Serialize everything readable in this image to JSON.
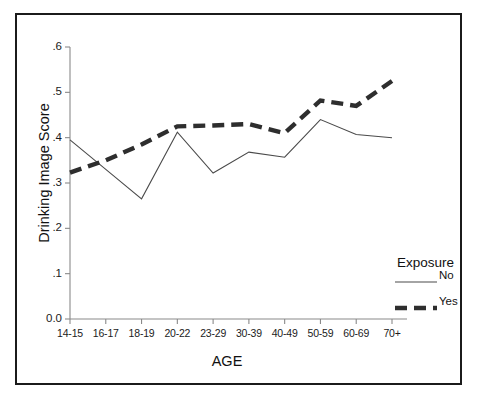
{
  "chart_data": {
    "type": "line",
    "title": "",
    "xlabel": "AGE",
    "ylabel": "Drinking Image Score",
    "categories": [
      "14-15",
      "16-17",
      "18-19",
      "20-22",
      "23-29",
      "30-39",
      "40-49",
      "50-59",
      "60-69",
      "70+"
    ],
    "ylim": [
      0.0,
      0.6
    ],
    "ytick_labels": [
      "0.0",
      ".1",
      ".2",
      ".3",
      ".4",
      ".5",
      ".6"
    ],
    "ytick_values": [
      0.0,
      0.1,
      0.2,
      0.3,
      0.4,
      0.5,
      0.6
    ],
    "grid": false,
    "legend_position": "right",
    "legend_title": "Exposure",
    "series": [
      {
        "name": "No",
        "style": "solid",
        "color": "#4a4a4a",
        "values": [
          0.395,
          0.33,
          0.265,
          0.412,
          0.322,
          0.368,
          0.357,
          0.44,
          0.407,
          0.4
        ]
      },
      {
        "name": "Yes",
        "style": "dashed",
        "color": "#2e2e2e",
        "values": [
          0.323,
          0.35,
          0.385,
          0.425,
          0.427,
          0.43,
          0.41,
          0.482,
          0.47,
          0.525
        ]
      }
    ]
  },
  "legend": {
    "title": "Exposure",
    "entries": [
      {
        "label": "No",
        "style": "solid"
      },
      {
        "label": "Yes",
        "style": "dashed"
      }
    ]
  },
  "axes": {
    "x_title": "AGE",
    "y_title": "Drinking Image Score"
  }
}
